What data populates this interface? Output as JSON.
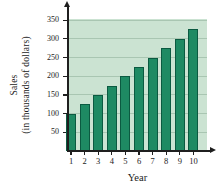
{
  "figure": {
    "background": "#ffffff",
    "plot_bg": "#cbe3d2",
    "bar_fill": "#1e8a63",
    "bar_border": "#0b5a41",
    "gridline_color": "#a9c6b2",
    "axis_color": "#1f1f1f",
    "text_color": "#1b1b1b"
  },
  "chart_data": {
    "type": "bar",
    "categories": [
      "1",
      "2",
      "3",
      "4",
      "5",
      "6",
      "7",
      "8",
      "9",
      "10"
    ],
    "values": [
      100,
      125,
      150,
      175,
      200,
      225,
      250,
      275,
      300,
      325
    ],
    "title": "",
    "xlabel": "Year",
    "ylabel": "Sales (in thousands of dollars)",
    "ylabel_lines": [
      "Sales",
      "(in thousands of dollars)"
    ],
    "yticks": [
      50,
      100,
      150,
      200,
      250,
      300,
      350
    ],
    "ylim": [
      0,
      370
    ],
    "grid": true,
    "legend": false
  }
}
